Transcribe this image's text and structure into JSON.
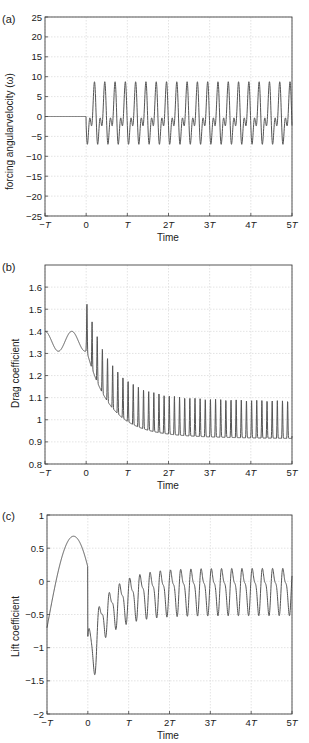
{
  "chart_data": [
    {
      "panel_label": "(a)",
      "type": "line",
      "title": "",
      "xlabel": "Time",
      "ylabel": "forcing angularvelocity (ω)",
      "xlim": [
        -1,
        5
      ],
      "ylim": [
        -25,
        25
      ],
      "x_ticks": [
        -1,
        0,
        1,
        2,
        3,
        4,
        5
      ],
      "x_tick_labels": [
        "−T",
        "0",
        "T",
        "2T",
        "3T",
        "4T",
        "5T"
      ],
      "y_ticks": [
        -25,
        -20,
        -15,
        -10,
        -5,
        0,
        5,
        10,
        15,
        20,
        25
      ],
      "y_tick_labels": [
        "−25",
        "−20",
        "−15",
        "−10",
        "−5",
        "0",
        "5",
        "10",
        "15",
        "20",
        "25"
      ],
      "grid": true,
      "line_color": "#555555",
      "description": "Zero for t<0; for t>=0 a two-harmonic periodic forcing oscillating between about -9 and +9 with a double-peak pattern, ~4 cycles per T",
      "series": [
        {
          "name": "forcing",
          "model": "forcing",
          "x": [
            -1,
            0,
            0.05,
            0.1,
            0.14,
            0.2,
            0.25,
            0.3,
            0.36,
            0.45,
            0.5,
            0.55,
            0.6,
            1.0,
            2.0,
            3.0,
            4.0,
            5.0
          ],
          "y": [
            0,
            0,
            -5,
            -1,
            -8.5,
            8.5,
            1,
            5,
            -5,
            -8,
            8.7,
            1,
            5,
            -9,
            -9,
            -9,
            -9,
            9
          ]
        }
      ]
    },
    {
      "panel_label": "(b)",
      "type": "line",
      "title": "",
      "xlabel": "Time",
      "ylabel": "Drag coefficient",
      "xlim": [
        -1,
        5
      ],
      "ylim": [
        0.8,
        1.7
      ],
      "x_ticks": [
        -1,
        0,
        1,
        2,
        3,
        4,
        5
      ],
      "x_tick_labels": [
        "−T",
        "0",
        "T",
        "2T",
        "3T",
        "4T",
        "5T"
      ],
      "y_ticks": [
        0.8,
        0.9,
        1.0,
        1.1,
        1.2,
        1.3,
        1.4,
        1.5,
        1.6
      ],
      "y_tick_labels": [
        "0.8",
        "0.9",
        "1",
        "1.1",
        "1.2",
        "1.3",
        "1.4",
        "1.5",
        "1.6"
      ],
      "grid": true,
      "line_color": "#555555",
      "description": "Smooth oscillation 1.31–1.40 before t=0, then spiky decay toward a periodic state between ~0.9 and ~1.12",
      "series": [
        {
          "name": "drag",
          "model": "drag",
          "x": [
            -1,
            -0.65,
            -0.35,
            0,
            0.1,
            0.3,
            0.5,
            0.75,
            1.0,
            1.5,
            2.0,
            3.0,
            4.0,
            5.0
          ],
          "y": [
            1.4,
            1.31,
            1.4,
            1.31,
            1.4,
            1.22,
            1.1,
            1.12,
            1.05,
            1.15,
            0.96,
            0.93,
            0.91,
            0.9
          ]
        }
      ]
    },
    {
      "panel_label": "(c)",
      "type": "line",
      "title": "",
      "xlabel": "Time",
      "ylabel": "Lift coefficient",
      "xlim": [
        -1,
        5
      ],
      "ylim": [
        -2,
        1
      ],
      "x_ticks": [
        -1,
        0,
        1,
        2,
        3,
        4,
        5
      ],
      "x_tick_labels": [
        "−T",
        "0",
        "T",
        "2T",
        "3T",
        "4T",
        "5T"
      ],
      "y_ticks": [
        -2,
        -1.5,
        -1,
        -0.5,
        0,
        0.5,
        1
      ],
      "y_tick_labels": [
        "−2",
        "−1.5",
        "−1",
        "−0.5",
        "0",
        "0.5",
        "1"
      ],
      "grid": true,
      "line_color": "#555555",
      "description": "Large smooth hump to ~0.68 at t≈-0.35T, drop to ~-1.45 after t=0, then periodic oscillation between ~-0.55 and ~0.35",
      "series": [
        {
          "name": "lift",
          "model": "lift",
          "x": [
            -1,
            -0.6,
            -0.35,
            -0.1,
            0,
            0.05,
            0.15,
            0.4,
            0.6,
            1.0,
            1.5,
            2.0,
            3.0,
            4.0,
            5.0
          ],
          "y": [
            -0.7,
            0.3,
            0.68,
            0.3,
            -0.18,
            -0.95,
            -1.45,
            -0.8,
            -0.25,
            -0.05,
            0.3,
            0.35,
            0.35,
            0.35,
            0.4
          ]
        }
      ]
    }
  ]
}
